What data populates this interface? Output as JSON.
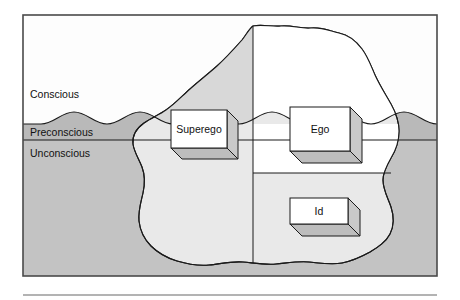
{
  "figure": {
    "frame": {
      "border_color": "#4a4a4a",
      "background": "#ffffff"
    },
    "footer_rule_color": "#9a9a9a"
  },
  "colors": {
    "sky": "#fdfdfd",
    "water_preconscious": "#b9b9b9",
    "water_unconscious": "#c3c3c3",
    "iceberg_light": "#ffffff",
    "iceberg_shadow": "#d8d8d8",
    "iceberg_submerged": "#e9e9e9",
    "outline": "#1a1a1a",
    "box_face": "#ffffff",
    "box_side": "#c9c9c9",
    "box_bottom": "#bdbdbd",
    "text": "#111111"
  },
  "zones": [
    {
      "id": "conscious",
      "label": "Conscious",
      "x": 30,
      "y": 98
    },
    {
      "id": "preconscious",
      "label": "Preconscious",
      "x": 30,
      "y": 133
    },
    {
      "id": "unconscious",
      "label": "Unconscious",
      "x": 30,
      "y": 154
    }
  ],
  "waterline": {
    "preconscious_top_y": 124,
    "preconscious_bottom_y": 140,
    "wave_amplitude": 8,
    "wave_count": 4
  },
  "structures": [
    {
      "id": "superego",
      "label": "Superego",
      "x": 171,
      "y": 110,
      "w": 56,
      "h": 38,
      "depth": 11,
      "zone": "spans preconscious and unconscious"
    },
    {
      "id": "ego",
      "label": "Ego",
      "x": 290,
      "y": 107,
      "w": 60,
      "h": 44,
      "depth": 12,
      "zone": "spans conscious, preconscious and unconscious"
    },
    {
      "id": "id",
      "label": "Id",
      "x": 290,
      "y": 198,
      "w": 58,
      "h": 26,
      "depth": 12,
      "zone": "unconscious"
    }
  ]
}
